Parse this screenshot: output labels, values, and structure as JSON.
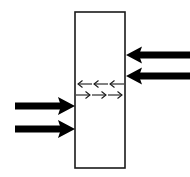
{
  "figure": {
    "title": "",
    "background_color": "#ffffff",
    "width": 190,
    "height": 177
  },
  "slab": {
    "name": "vertical slab",
    "x": 75,
    "y": 12,
    "width": 50,
    "height": 156,
    "fill_color": "#ffffff",
    "stroke_color": "#1a1a1a",
    "stroke_width": 1.6
  },
  "thick_arrows": {
    "color": "#000000",
    "shaft_width": 7,
    "items": [
      {
        "id": "right-side-upper",
        "label": "",
        "direction": "left",
        "side": "right",
        "tail_x": 190,
        "tip_x": 126,
        "y": 55
      },
      {
        "id": "right-side-lower",
        "label": "",
        "direction": "left",
        "side": "right",
        "tail_x": 190,
        "tip_x": 126,
        "y": 76
      },
      {
        "id": "left-side-upper",
        "label": "",
        "direction": "right",
        "side": "left",
        "tail_x": 15,
        "tip_x": 75,
        "y": 106
      },
      {
        "id": "left-side-lower",
        "label": "",
        "direction": "right",
        "side": "left",
        "tail_x": 15,
        "tip_x": 75,
        "y": 129
      }
    ]
  },
  "thin_arrows": {
    "color": "#1a1a1a",
    "stroke_width": 1.1,
    "rows": [
      {
        "id": "interior-row-upper",
        "label": "",
        "direction": "left",
        "y": 84,
        "count": 3,
        "start_x": 76,
        "end_x": 124
      },
      {
        "id": "interior-row-lower",
        "label": "",
        "direction": "right",
        "y": 95,
        "count": 3,
        "start_x": 76,
        "end_x": 124
      }
    ]
  }
}
